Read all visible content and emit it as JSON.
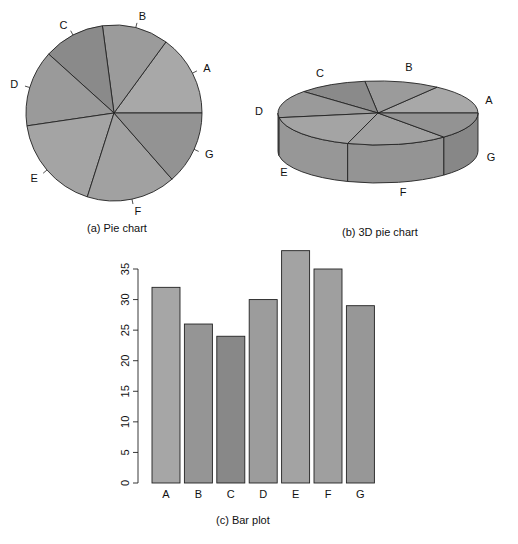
{
  "chart_data": [
    {
      "type": "pie",
      "caption": "(a) Pie chart",
      "categories": [
        "A",
        "B",
        "C",
        "D",
        "E",
        "F",
        "G"
      ],
      "values": [
        32,
        26,
        24,
        30,
        38,
        35,
        29
      ],
      "colors": [
        "#a8a8a8",
        "#9b9b9b",
        "#8a8a8a",
        "#9a9a9a",
        "#a4a4a4",
        "#a1a1a1",
        "#939393"
      ],
      "start_angle_deg": 0,
      "direction": "counterclockwise"
    },
    {
      "type": "pie",
      "variant": "3d",
      "caption": "(b) 3D pie chart",
      "categories": [
        "A",
        "B",
        "C",
        "D",
        "E",
        "F",
        "G"
      ],
      "values": [
        32,
        26,
        24,
        30,
        38,
        35,
        29
      ],
      "colors": [
        "#a8a8a8",
        "#9b9b9b",
        "#8a8a8a",
        "#9a9a9a",
        "#a4a4a4",
        "#a1a1a1",
        "#939393"
      ],
      "start_angle_deg": 0,
      "direction": "counterclockwise"
    },
    {
      "type": "bar",
      "caption": "(c) Bar plot",
      "categories": [
        "A",
        "B",
        "C",
        "D",
        "E",
        "F",
        "G"
      ],
      "values": [
        32,
        26,
        24,
        30,
        38,
        35,
        29
      ],
      "colors": [
        "#a6a6a6",
        "#959595",
        "#888888",
        "#9c9c9c",
        "#a3a3a3",
        "#9f9f9f",
        "#979797"
      ],
      "yticks": [
        0,
        5,
        10,
        15,
        20,
        25,
        30,
        35
      ],
      "ylim": [
        0,
        38
      ],
      "xlabel": "",
      "ylabel": "",
      "title": ""
    }
  ]
}
